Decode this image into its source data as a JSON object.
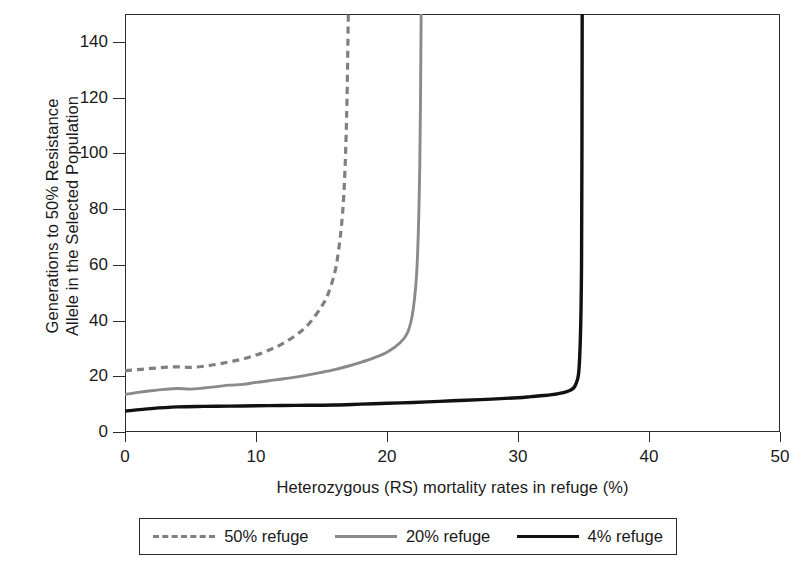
{
  "chart_data": {
    "type": "line",
    "title": "",
    "xlabel": "Heterozygous (RS) mortality rates in refuge (%)",
    "ylabel": "Generations to 50% Resistance Allele in the Selected Population",
    "ylabel_line1": "Generations to 50% Resistance",
    "ylabel_line2": "Allele in the Selected Population",
    "xlim": [
      0,
      50
    ],
    "ylim": [
      0,
      150
    ],
    "xticks": [
      0,
      10,
      20,
      30,
      40,
      50
    ],
    "yticks": [
      0,
      20,
      40,
      60,
      80,
      100,
      120,
      140
    ],
    "grid": false,
    "legend_position": "below-axes",
    "series": [
      {
        "name": "50% refuge",
        "style": "dashed",
        "color": "#808080",
        "asymptote_x": 17.1,
        "x": [
          0,
          1,
          2,
          3,
          4,
          5,
          6,
          7,
          8,
          9,
          10,
          11,
          12,
          13,
          14,
          15,
          15.5,
          16,
          16.3,
          16.6,
          16.8,
          16.95,
          17.05
        ],
        "y": [
          22.0,
          22.4,
          22.8,
          23.2,
          23.4,
          23.2,
          23.6,
          24.3,
          25.2,
          26.2,
          27.6,
          29.4,
          31.6,
          34.6,
          38.6,
          45.0,
          49.5,
          57.0,
          65.0,
          78.0,
          95.0,
          120.0,
          150.0
        ]
      },
      {
        "name": "20% refuge",
        "style": "solid",
        "color": "#8a8a8a",
        "asymptote_x": 22.6,
        "x": [
          0,
          1,
          2,
          3,
          4,
          5,
          6,
          7,
          8,
          9,
          10,
          11,
          12,
          13,
          14,
          15,
          16,
          17,
          18,
          19,
          20,
          21,
          21.6,
          22.0,
          22.3,
          22.5,
          22.6
        ],
        "y": [
          13.5,
          14.2,
          14.8,
          15.3,
          15.6,
          15.4,
          15.8,
          16.3,
          16.8,
          17.1,
          17.8,
          18.4,
          19.0,
          19.7,
          20.5,
          21.4,
          22.4,
          23.6,
          25.0,
          26.6,
          28.6,
          32.0,
          36.0,
          44.0,
          60.0,
          95.0,
          145.0
        ]
      },
      {
        "name": "4% refuge",
        "style": "solid",
        "color": "#111111",
        "asymptote_x": 34.9,
        "x": [
          0,
          2,
          4,
          6,
          8,
          10,
          12,
          14,
          16,
          18,
          20,
          22,
          24,
          26,
          28,
          30,
          31,
          32,
          33,
          33.8,
          34.4,
          34.7,
          34.85,
          34.9
        ],
        "y": [
          7.5,
          8.4,
          9.0,
          9.2,
          9.3,
          9.4,
          9.5,
          9.6,
          9.7,
          10.0,
          10.3,
          10.6,
          11.0,
          11.4,
          11.8,
          12.3,
          12.7,
          13.1,
          13.7,
          14.6,
          17.0,
          26.0,
          60.0,
          150.0
        ]
      }
    ]
  },
  "legend": {
    "entries": [
      {
        "label": "50% refuge",
        "style": "dashed",
        "color": "#808080"
      },
      {
        "label": "20% refuge",
        "style": "solid",
        "color": "#8a8a8a"
      },
      {
        "label": "4% refuge",
        "style": "solid",
        "color": "#111111"
      }
    ]
  },
  "axes": {
    "x_tick_labels": [
      "0",
      "10",
      "20",
      "30",
      "40",
      "50"
    ],
    "y_tick_labels": [
      "0",
      "20",
      "40",
      "60",
      "80",
      "100",
      "120",
      "140"
    ]
  },
  "colors": {
    "frame": "#2b2b2b",
    "text": "#1a1a1a",
    "background": "#ffffff"
  }
}
